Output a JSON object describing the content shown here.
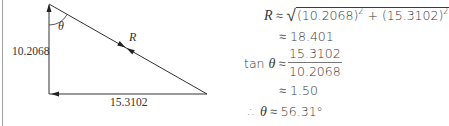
{
  "diagram": {
    "vertical_side_label": "10.2068",
    "horizontal_side_label": "15.3102",
    "hypotenuse_label": "R",
    "angle_label": "θ"
  },
  "equations": {
    "row1": {
      "lhs": "R",
      "op": "≈",
      "radicand_a": "(10.2068)",
      "radicand_plus": "+",
      "radicand_b": "(15.3102)",
      "exp": "2"
    },
    "row2": {
      "op": "≈",
      "value": "18.401"
    },
    "row3": {
      "lhs_fn": "tan",
      "lhs_var": "θ",
      "op": "≈",
      "numerator": "15.3102",
      "denominator": "10.2068"
    },
    "row4": {
      "op": "≈",
      "value": "1.50"
    },
    "row5": {
      "therefore": "∴",
      "var": "θ",
      "op": "≈",
      "value": "56.31°"
    }
  },
  "colors": {
    "line": "#333333",
    "text": "#3a3a3a",
    "border": "#9a9a9a"
  }
}
